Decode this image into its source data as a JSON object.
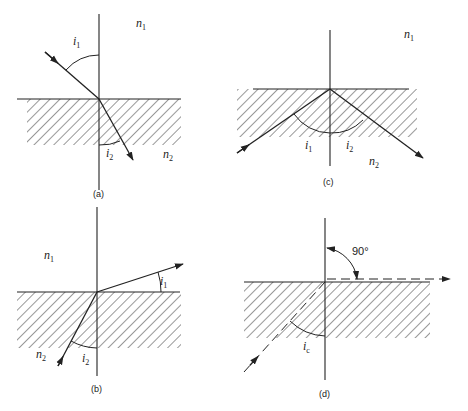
{
  "figure": {
    "panels": [
      {
        "id": "a",
        "caption": "(a)",
        "labels": {
          "n_top": "n",
          "n_top_sub": "1",
          "n_bottom": "n",
          "n_bottom_sub": "2",
          "angle1": "i",
          "angle1_sub": "1",
          "angle2": "i",
          "angle2_sub": "2"
        },
        "description": "Ray incident from medium n1 refracts into hatched medium n2, bending toward the normal"
      },
      {
        "id": "b",
        "caption": "(b)",
        "labels": {
          "n_top": "n",
          "n_top_sub": "1",
          "n_bottom": "n",
          "n_bottom_sub": "2",
          "angle1": "i",
          "angle1_sub": "1",
          "angle2": "i",
          "angle2_sub": "2"
        },
        "description": "Ray from hatched medium n2 refracts into n1 at a grazing angle i1 measured from the interface"
      },
      {
        "id": "c",
        "caption": "(c)",
        "labels": {
          "n_top": "n",
          "n_top_sub": "1",
          "n_bottom": "n",
          "n_bottom_sub": "2",
          "angle1": "i",
          "angle1_sub": "1",
          "angle2": "i",
          "angle2_sub": "2"
        },
        "description": "Total internal reflection within hatched medium n2 with equal angles i1 and i2"
      },
      {
        "id": "d",
        "caption": "(d)",
        "labels": {
          "right_angle": "90°",
          "critical_angle": "i",
          "critical_angle_sub": "c"
        },
        "description": "Critical angle case: refracted ray travels along the interface (dashed) at 90° to the normal"
      }
    ],
    "colors": {
      "ink": "#222222",
      "background": "#ffffff"
    }
  }
}
